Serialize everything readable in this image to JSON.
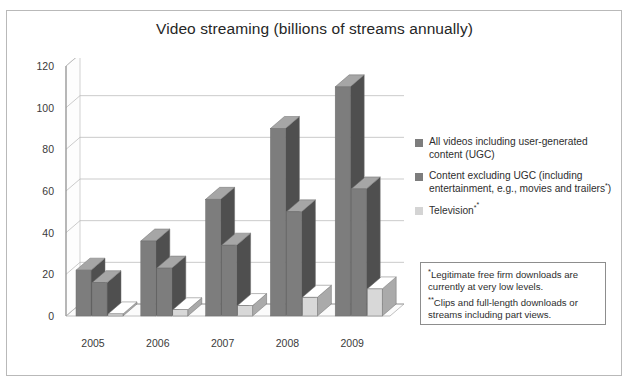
{
  "figure": {
    "title": "Video streaming (billions of streams annually)"
  },
  "legend": {
    "items": [
      {
        "label": "All videos including user-generated content (UGC)",
        "color": "#7d7d7d",
        "name": "all-videos-ugc"
      },
      {
        "label": "Content excluding UGC (including entertainment, e.g., movies and trailers*)",
        "color": "#7d7d7d",
        "name": "content-excluding-ugc"
      },
      {
        "label": "Television**",
        "color": "#d4d4d4",
        "name": "television"
      }
    ]
  },
  "footnotes": [
    {
      "mark": "*",
      "text": "Legitimate free firm downloads are currently at very low levels."
    },
    {
      "mark": "**",
      "text": "Clips and full-length downloads or streams including part views."
    }
  ],
  "chart_data": {
    "type": "bar",
    "title": "Video streaming (billions of streams annually)",
    "xlabel": "",
    "ylabel": "",
    "ylim": [
      0,
      120
    ],
    "yticks": [
      0,
      20,
      40,
      60,
      80,
      100,
      120
    ],
    "grid": true,
    "legend_position": "right",
    "categories": [
      "2005",
      "2006",
      "2007",
      "2008",
      "2009"
    ],
    "series": [
      {
        "name": "All videos including user-generated content (UGC)",
        "color": "#7d7d7d",
        "values": [
          22,
          36,
          56,
          90,
          110
        ]
      },
      {
        "name": "Content excluding UGC (including entertainment, e.g., movies and trailers*)",
        "color": "#7d7d7d",
        "values": [
          16,
          23,
          34,
          50,
          61
        ]
      },
      {
        "name": "Television**",
        "color": "#d8d8d8",
        "values": [
          1,
          3,
          5,
          9,
          13
        ]
      }
    ]
  }
}
